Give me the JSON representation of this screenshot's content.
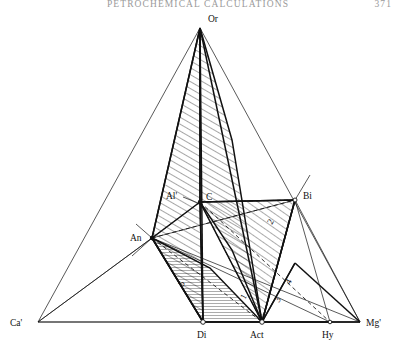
{
  "page": {
    "running_head": "PETROCHEMICAL CALCULATIONS",
    "folio": "371",
    "width": 396,
    "height": 351,
    "background": "#ffffff",
    "ink": "#000000",
    "head_color": "#9a9a9a"
  },
  "figure": {
    "type": "phase-diagram",
    "vertices": [
      {
        "id": "Or",
        "label": "Or",
        "x": 200,
        "y": 28,
        "lx": 208,
        "ly": 22,
        "marker": false
      },
      {
        "id": "Ca",
        "label": "Ca'",
        "x": 38,
        "y": 322,
        "lx": 10,
        "ly": 326,
        "marker": false
      },
      {
        "id": "Mg",
        "label": "Mg'",
        "x": 360,
        "y": 322,
        "lx": 366,
        "ly": 326,
        "marker": false
      },
      {
        "id": "Di",
        "label": "Di",
        "x": 203,
        "y": 322,
        "lx": 197,
        "ly": 338,
        "marker": true
      },
      {
        "id": "Act",
        "label": "Act",
        "x": 262,
        "y": 322,
        "lx": 252,
        "ly": 338,
        "marker": true
      },
      {
        "id": "Hy",
        "label": "Hy",
        "x": 330,
        "y": 322,
        "lx": 322,
        "ly": 338,
        "marker": true
      },
      {
        "id": "An",
        "label": "An",
        "x": 152,
        "y": 238,
        "lx": 130,
        "ly": 241,
        "marker": true
      },
      {
        "id": "C",
        "label": "C",
        "x": 200,
        "y": 202,
        "lx": 206,
        "ly": 200,
        "marker": true
      },
      {
        "id": "Bi",
        "label": "Bi",
        "x": 295,
        "y": 200,
        "lx": 303,
        "ly": 199,
        "marker": true
      },
      {
        "id": "Al",
        "label": "Al'",
        "x": 176,
        "y": 196,
        "lx": 168,
        "ly": 199,
        "marker": false
      }
    ],
    "region_numbers": [
      {
        "label": "1",
        "x": 245,
        "y": 300,
        "rotate": -62
      },
      {
        "label": "2",
        "x": 272,
        "y": 225,
        "rotate": -62
      },
      {
        "label": "3",
        "x": 279,
        "y": 303,
        "rotate": -62
      },
      {
        "label": "4",
        "x": 290,
        "y": 285,
        "rotate": -62
      },
      {
        "label": "5",
        "x": 183,
        "y": 287,
        "rotate": -62
      }
    ],
    "hatch_styles": {
      "diagonal": "45-degree fine line hatch",
      "horizontal": "horizontal fine line hatch"
    },
    "line_styles": {
      "solid_thin": 0.7,
      "solid_thick": 1.5,
      "dashed": "4 3"
    }
  }
}
